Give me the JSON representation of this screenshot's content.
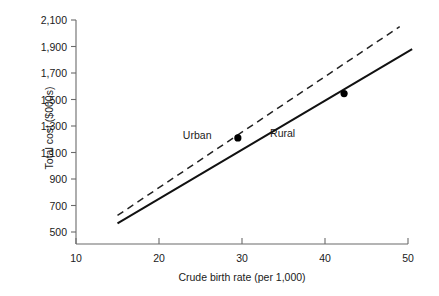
{
  "chart_data": {
    "type": "line",
    "title": "",
    "xlabel": "Crude birth rate (per 1,000)",
    "ylabel": "Total cost ($000s)",
    "xlim": [
      10,
      50
    ],
    "ylim": [
      500,
      2100
    ],
    "xticks": [
      "10",
      "20",
      "30",
      "40",
      "50"
    ],
    "xtick_values": [
      10,
      20,
      30,
      40,
      50
    ],
    "yticks": [
      "500",
      "700",
      "900",
      "1,100",
      "1,300",
      "1,500",
      "1,700",
      "1,900",
      "2,100"
    ],
    "ytick_values": [
      500,
      700,
      900,
      1100,
      1300,
      1500,
      1700,
      1900,
      2100
    ],
    "grid": false,
    "legend_position": "inline-annotation",
    "series": [
      {
        "name": "Urban",
        "style": "dashed",
        "color": "#222222",
        "x": [
          15,
          49
        ],
        "values": [
          625,
          2050
        ],
        "points": [
          {
            "x": 29.5,
            "y": 1210
          }
        ],
        "label": "Urban",
        "label_x": 24.6,
        "label_y": 1232
      },
      {
        "name": "Rural",
        "style": "solid",
        "color": "#111111",
        "x": [
          15,
          50.5
        ],
        "values": [
          565,
          1880
        ],
        "points": [
          {
            "x": 42.3,
            "y": 1545
          }
        ],
        "label": "Rural",
        "label_x": 34.9,
        "label_y": 1250
      }
    ]
  },
  "axes": {
    "y_title": "Total cost ($000s)",
    "x_title": "Crude birth rate (per 1,000)"
  },
  "annotations": {
    "urban": "Urban",
    "rural": "Rural"
  },
  "colors": {
    "axis": "#6b6b6b",
    "text": "#1a1a1a",
    "urban_line": "#222222",
    "rural_line": "#111111",
    "marker": "#000000",
    "background": "#ffffff"
  }
}
